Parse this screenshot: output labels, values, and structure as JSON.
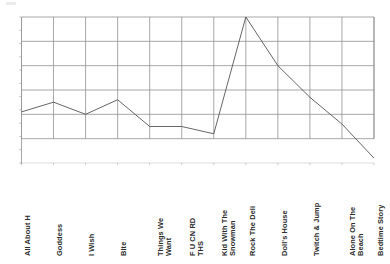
{
  "chart_data": {
    "type": "line",
    "title": "",
    "subtitle": "",
    "xlabel": "",
    "ylabel": "",
    "grid": true,
    "legend": false,
    "legend_position": "none",
    "categories": [
      "All About H",
      "Goddess",
      "I Wish",
      "Bite",
      "Things We\nWant",
      "F U CN RD\nTHS",
      "Kid With The\nSnowman",
      "Rock The Deli",
      "Doll's House",
      "Twitch & Jump",
      "Alone On The\nBeach",
      "Bedtime Story"
    ],
    "values": [
      2.1,
      2.5,
      2.0,
      2.6,
      1.5,
      1.5,
      1.2,
      6.0,
      4.0,
      2.7,
      1.6,
      0.2
    ],
    "ylim": [
      0,
      6
    ],
    "xlim": [
      0,
      11
    ],
    "yticks": [
      0,
      1,
      2,
      3,
      4,
      5,
      6
    ],
    "ytick_labels": [
      "",
      "",
      "",
      "",
      "",
      "",
      ""
    ],
    "series": [
      {
        "name": "",
        "values": [
          2.1,
          2.5,
          2.0,
          2.6,
          1.5,
          1.5,
          1.2,
          6.0,
          4.0,
          2.7,
          1.6,
          0.2
        ]
      }
    ],
    "grid_rows": 6,
    "grid_cols": 11,
    "line_color": "#555555",
    "grid_color": "#8f8f8f",
    "axis_color": "#9a9a9a"
  },
  "colors": {
    "background": "#ffffff",
    "line": "#555555",
    "grid": "#8f8f8f",
    "axis": "#9a9a9a",
    "label_text": "#2b2b2b"
  }
}
